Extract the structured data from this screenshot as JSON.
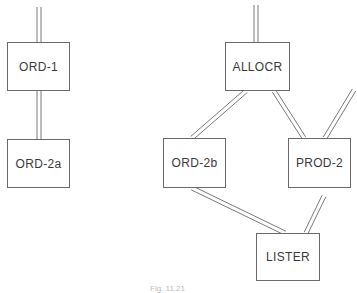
{
  "diagram": {
    "nodes": [
      {
        "id": "ord1",
        "label": "ORD-1",
        "x": 7,
        "y": 42,
        "w": 63,
        "h": 49
      },
      {
        "id": "ord2a",
        "label": "ORD-2a",
        "x": 7,
        "y": 139,
        "w": 63,
        "h": 49
      },
      {
        "id": "allocr",
        "label": "ALLOCR",
        "x": 225,
        "y": 42,
        "w": 65,
        "h": 49
      },
      {
        "id": "ord2b",
        "label": "ORD-2b",
        "x": 163,
        "y": 138,
        "w": 63,
        "h": 50
      },
      {
        "id": "prod2",
        "label": "PROD-2",
        "x": 288,
        "y": 138,
        "w": 63,
        "h": 50
      },
      {
        "id": "lister",
        "label": "LISTER",
        "x": 256,
        "y": 233,
        "w": 64,
        "h": 48
      }
    ],
    "edges": [
      {
        "from": "external",
        "to": "ord1",
        "x1": 39,
        "y1": 7,
        "x2": 39,
        "y2": 42
      },
      {
        "from": "ord1",
        "to": "ord2a",
        "x1": 39,
        "y1": 91,
        "x2": 39,
        "y2": 139
      },
      {
        "from": "external",
        "to": "allocr",
        "x1": 256,
        "y1": 5,
        "x2": 256,
        "y2": 42
      },
      {
        "from": "allocr",
        "to": "ord2b",
        "x1": 246,
        "y1": 91,
        "x2": 192,
        "y2": 138
      },
      {
        "from": "allocr",
        "to": "prod2",
        "x1": 274,
        "y1": 91,
        "x2": 304,
        "y2": 138
      },
      {
        "from": "external",
        "to": "prod2",
        "x1": 354,
        "y1": 90,
        "x2": 325,
        "y2": 138
      },
      {
        "from": "ord2b",
        "to": "lister",
        "x1": 192,
        "y1": 188,
        "x2": 285,
        "y2": 233
      },
      {
        "from": "external",
        "to": "lister",
        "x1": 324,
        "y1": 196,
        "x2": 306,
        "y2": 233
      }
    ],
    "caption": "Fig. 11.21"
  }
}
